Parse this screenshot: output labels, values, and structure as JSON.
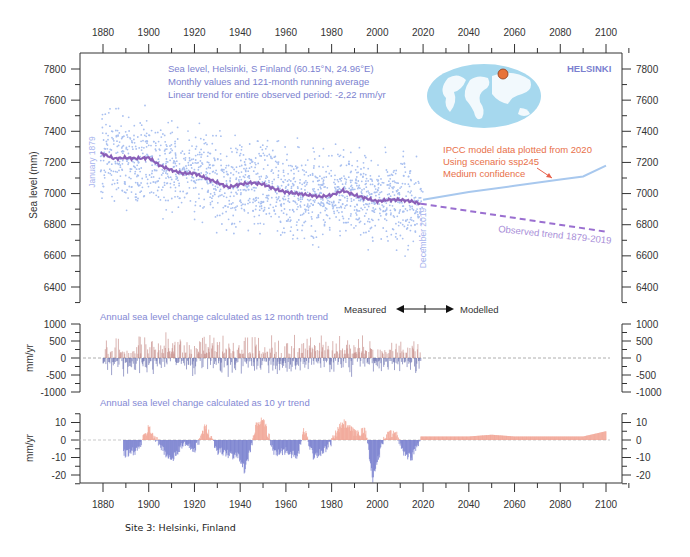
{
  "figure": {
    "caption": "Site 3: Helsinki, Finland",
    "station_label": "HELSINKI",
    "info_lines": [
      "Sea level, Helsinki, S Finland (60.15°N, 24.96°E)",
      "Monthly values and 121-month running average",
      "Linear trend for entire observed period: -2,22 mm/yr"
    ],
    "ipcc_lines": [
      "IPCC model data plotted from 2020",
      "Using scenario ssp245",
      "Medium confidence"
    ],
    "start_label": "January 1879",
    "end_label": "December 2019",
    "trend_label": "Observed trend 1879-2019",
    "measured_label": "Measured",
    "modelled_label": "Modelled",
    "panel2_title": "Annual sea level change calculated as 12 month trend",
    "panel3_title": "Annual sea level change calculated as 10 yr trend",
    "colors": {
      "scatter": "#a9c0f0",
      "running_avg": "#8a5fb8",
      "trend_dash": "#9a6fd0",
      "model_line": "#a8c8ee",
      "positive": "#e8604a",
      "negative": "#5a62c0",
      "map_ocean": "#a6d8ee",
      "map_marker": "#e8733a"
    }
  },
  "chart_data": [
    {
      "type": "scatter",
      "title": "Sea level, Helsinki, S Finland (60.15°N, 24.96°E)",
      "xlabel": "",
      "ylabel": "Sea level (mm)",
      "xlim": [
        1870,
        2110
      ],
      "ylim": [
        6300,
        7850
      ],
      "x_ticks": [
        1880,
        1900,
        1920,
        1940,
        1960,
        1980,
        2000,
        2020,
        2040,
        2060,
        2080,
        2100
      ],
      "y_ticks": [
        6400,
        6600,
        6800,
        7000,
        7200,
        7400,
        7600,
        7800
      ],
      "series": [
        {
          "name": "121-month running average",
          "x": [
            1879,
            1885,
            1890,
            1895,
            1900,
            1905,
            1910,
            1915,
            1920,
            1925,
            1930,
            1935,
            1940,
            1945,
            1950,
            1955,
            1960,
            1965,
            1970,
            1975,
            1980,
            1985,
            1990,
            1995,
            2000,
            2005,
            2010,
            2015,
            2019
          ],
          "values": [
            7260,
            7225,
            7230,
            7225,
            7230,
            7180,
            7150,
            7130,
            7130,
            7100,
            7070,
            7040,
            7060,
            7070,
            7060,
            7030,
            7010,
            7000,
            6990,
            6980,
            6990,
            7020,
            6990,
            6970,
            6950,
            6960,
            6960,
            6950,
            6935
          ]
        },
        {
          "name": "Observed trend 1879-2019 (extrapolated)",
          "x": [
            2019,
            2100
          ],
          "values": [
            6935,
            6755
          ]
        },
        {
          "name": "IPCC model ssp245",
          "x": [
            2020,
            2040,
            2060,
            2080,
            2090,
            2100
          ],
          "values": [
            6960,
            7010,
            7050,
            7090,
            7110,
            7180
          ]
        }
      ],
      "annotations": [
        "January 1879",
        "December 2019",
        "Observed trend 1879-2019",
        "IPCC model data plotted from 2020",
        "Using scenario ssp245",
        "Medium confidence",
        "HELSINKI"
      ]
    },
    {
      "type": "bar",
      "title": "Annual sea level change calculated as 12 month trend",
      "ylabel": "mm/yr",
      "ylim": [
        -1000,
        1000
      ],
      "y_ticks": [
        -1000,
        -500,
        0,
        500,
        1000
      ],
      "x_range": [
        1880,
        2019
      ],
      "values_range": [
        -650,
        800
      ]
    },
    {
      "type": "area",
      "title": "Annual sea level change calculated as 10 yr trend",
      "ylabel": "mm/yr",
      "ylim": [
        -25,
        15
      ],
      "y_ticks": [
        -20,
        -10,
        0,
        10
      ],
      "x": [
        1889,
        1895,
        1900,
        1905,
        1910,
        1915,
        1920,
        1925,
        1930,
        1935,
        1940,
        1942,
        1947,
        1950,
        1955,
        1960,
        1965,
        1968,
        1972,
        1978,
        1985,
        1990,
        1995,
        1998,
        2003,
        2008,
        2012,
        2015,
        2019,
        2040,
        2050,
        2060,
        2080,
        2090,
        2100
      ],
      "values": [
        -8,
        -6,
        7,
        -3,
        -12,
        -2,
        -6,
        8,
        -6,
        -8,
        -10,
        -18,
        8,
        12,
        -8,
        -6,
        -10,
        6,
        -9,
        -5,
        10,
        4,
        5,
        -22,
        2,
        4,
        -8,
        -10,
        2,
        2,
        3,
        2,
        2,
        2,
        5
      ]
    }
  ]
}
